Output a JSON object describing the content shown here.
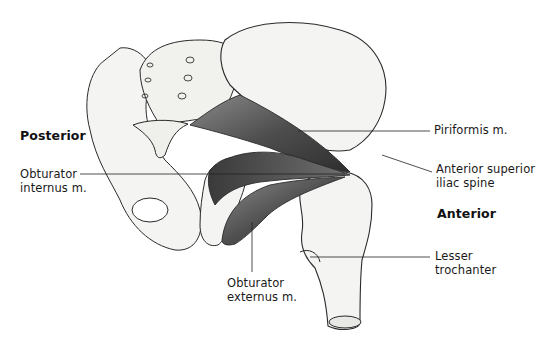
{
  "diagram": {
    "orientation_labels": {
      "posterior": "Posterior",
      "anterior": "Anterior"
    },
    "labels": {
      "piriformis": "Piriformis m.",
      "asis_line1": "Anterior superior",
      "asis_line2": "iliac spine",
      "obt_int_line1": "Obturator",
      "obt_int_line2": "internus m.",
      "obt_ext_line1": "Obturator",
      "obt_ext_line2": "externus m.",
      "lesser_line1": "Lesser",
      "lesser_line2": "trochanter"
    },
    "colors": {
      "bone_fill": "#f4f4f2",
      "outline": "#2a2a2a",
      "muscle_dark": "#4a4a4a",
      "muscle_mid": "#6e6e6e",
      "leader_line": "#222222"
    }
  }
}
